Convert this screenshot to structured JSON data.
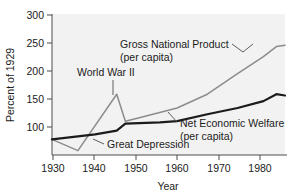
{
  "chart_data": {
    "type": "line",
    "title": "",
    "xlabel": "Year",
    "ylabel": "Percent of 1929",
    "xlim": [
      1930,
      1984
    ],
    "ylim": [
      75,
      300
    ],
    "grid": false,
    "legend_position": "inline-annotations",
    "xticks": [
      1930,
      1940,
      1950,
      1960,
      1970,
      1980
    ],
    "xtick_labels": [
      "1930",
      "1940",
      "1950",
      "1960",
      "1970",
      "1980"
    ],
    "yticks": [
      100,
      150,
      200,
      250,
      300
    ],
    "ytick_labels": [
      "100",
      "150",
      "200",
      "250",
      "300"
    ],
    "series": [
      {
        "name": "Gross National Product (per capita)",
        "color": "#8c8c8c",
        "x": [
          1930,
          1936,
          1945,
          1947,
          1950,
          1959,
          1966,
          1973,
          1979,
          1982,
          1984
        ],
        "values": [
          100,
          82,
          172,
          129,
          134,
          150,
          172,
          205,
          232,
          248,
          250
        ]
      },
      {
        "name": "Net Economic Welfare (per capita)",
        "color": "#1b1b1b",
        "x": [
          1930,
          1940,
          1945,
          1947,
          1955,
          1959,
          1966,
          1973,
          1979,
          1982,
          1984
        ],
        "values": [
          100,
          108,
          114,
          125,
          127,
          129,
          140,
          150,
          161,
          172,
          170
        ]
      }
    ],
    "annotations": [
      {
        "id": "gnp",
        "lines": [
          "Gross National Product",
          "(per capita)"
        ],
        "text_x": 1966,
        "text_y": 252
      },
      {
        "id": "wwii",
        "lines": [
          "World War II"
        ],
        "text_x": 1945,
        "text_y": 207
      },
      {
        "id": "new",
        "lines": [
          "Net Economic Welfare",
          "(per capita)"
        ],
        "text_x": 1966,
        "text_y": 113
      },
      {
        "id": "great-depression",
        "lines": [
          "Great Depression"
        ],
        "text_x": 1944,
        "text_y": 84
      }
    ]
  },
  "axis": {
    "y_title": "Percent of 1929",
    "x_title": "Year"
  },
  "ytick": {
    "t0": "100",
    "t1": "150",
    "t2": "200",
    "t3": "250",
    "t4": "300"
  },
  "xtick": {
    "t0": "1930",
    "t1": "1940",
    "t2": "1950",
    "t3": "1960",
    "t4": "1970",
    "t5": "1980"
  },
  "annotations": {
    "gnp_line1": "Gross National Product",
    "gnp_line2": "(per capita)",
    "wwii": "World War II",
    "new_line1": "Net Economic Welfare",
    "new_line2": "(per capita)",
    "depression": "Great Depression"
  },
  "colors": {
    "gnp_series": "#8c8c8c",
    "new_series": "#1b1b1b",
    "plot_background": "#f2f2f2",
    "axis": "#4d4d4d",
    "text": "#1b1b1b"
  }
}
